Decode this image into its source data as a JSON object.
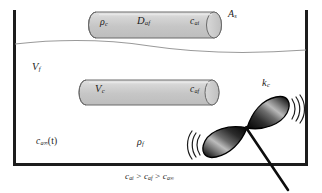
{
  "figure": {
    "kind": "schematic-diagram",
    "colors": {
      "outline": "#1c1c1c",
      "cylinder_fill": "#c9c9c9",
      "cylinder_edge": "#6a6a6a",
      "surface_line": "#8d8d8d",
      "blade_dark": "#141414",
      "blade_light": "#f0f0f0",
      "background": "#ffffff"
    }
  },
  "labels": {
    "rho_c": {
      "base": "ρ",
      "sub": "c",
      "name": "cylinder-density"
    },
    "d_af": {
      "base": "D",
      "sub": "af",
      "name": "diffusivity"
    },
    "c_ai": {
      "base": "c",
      "sub": "ai",
      "name": "interface-concentration"
    },
    "a_s": {
      "base": "A",
      "sub": "s",
      "name": "surface-area"
    },
    "v_f": {
      "base": "V",
      "sub": "f",
      "name": "fluid-volume"
    },
    "v_c": {
      "base": "V",
      "sub": "c",
      "name": "cylinder-volume"
    },
    "c_af": {
      "base": "c",
      "sub": "af",
      "name": "film-concentration"
    },
    "k_c": {
      "base": "k",
      "sub": "c",
      "name": "mass-transfer-coefficient"
    },
    "c_ainf_t": {
      "base": "c",
      "sub": "a∞",
      "suffix": "(t)",
      "name": "bulk-concentration-time"
    },
    "rho_f": {
      "base": "ρ",
      "sub": "f",
      "name": "fluid-density"
    },
    "inequality": {
      "text": "c",
      "name": "concentration-inequality"
    }
  },
  "inequality": {
    "term1_base": "c",
    "term1_sub": "ai",
    "op1": " > ",
    "term2_base": "c",
    "term2_sub": "af",
    "op2": " > ",
    "term3_base": "c",
    "term3_sub": "a∞"
  },
  "elements": {
    "vessel": "open-top rectangular vessel",
    "surface": "free fluid surface (wavy line)",
    "cylinder_top": "upper horizontal cylinder",
    "cylinder_bottom": "lower horizontal cylinder",
    "impeller": "two-blade impeller with shaft",
    "motion_arcs_left": "(((",
    "motion_arcs_right": ")))"
  }
}
